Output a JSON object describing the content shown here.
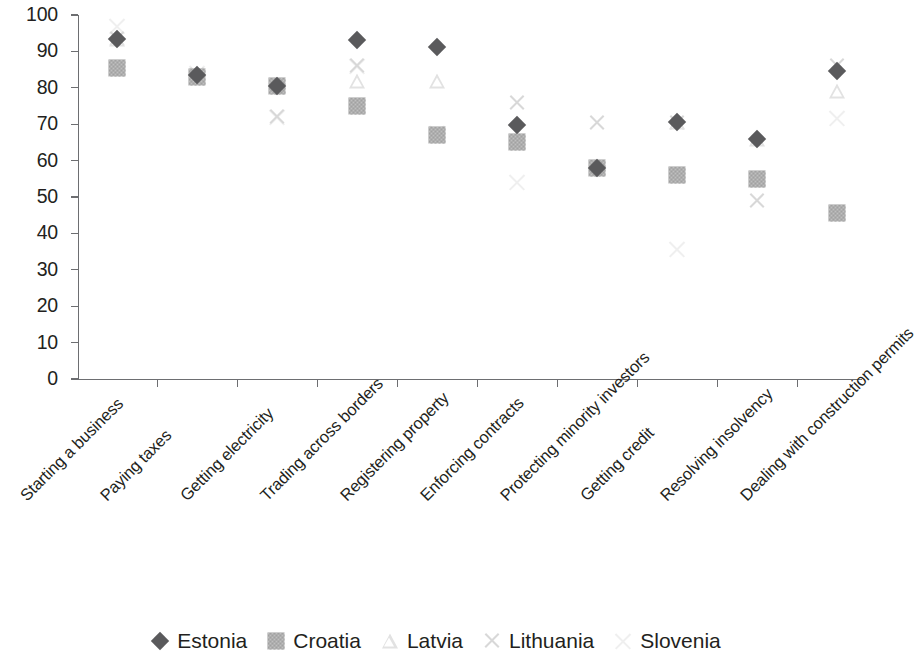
{
  "chart_data": {
    "type": "scatter",
    "title": "",
    "subtitle": "",
    "xlabel": "",
    "ylabel": "",
    "ylim": [
      0,
      100
    ],
    "ytick_step": 10,
    "yticks": [
      0,
      10,
      20,
      30,
      40,
      50,
      60,
      70,
      80,
      90,
      100
    ],
    "grid": false,
    "legend_position": "bottom",
    "xlabel_rotation": -45,
    "categories": [
      "Starting a business",
      "Paying taxes",
      "Getting electricity",
      "Trading across borders",
      "Registering property",
      "Enforcing contracts",
      "Protecting minority investors",
      "Getting credit",
      "Resolving insolvency",
      "Dealing with construction permits"
    ],
    "series": [
      {
        "name": "Estonia",
        "marker": "filled-diamond",
        "color": "#5a5a5c",
        "values": [
          93.5,
          83.5,
          80.5,
          93.0,
          91.2,
          69.8,
          58.0,
          70.5,
          66.0,
          84.5
        ]
      },
      {
        "name": "Croatia",
        "marker": "textured-square",
        "color": "#bfbfbf",
        "values": [
          85.5,
          83.0,
          80.5,
          75.0,
          67.0,
          65.0,
          58.0,
          56.0,
          55.0,
          45.5
        ]
      },
      {
        "name": "Latvia",
        "marker": "light-triangle",
        "color": "#e2e2e2",
        "values": [
          93.5,
          83.5,
          80.5,
          82.0,
          82.0,
          65.0,
          58.5,
          70.5,
          66.0,
          79.0
        ]
      },
      {
        "name": "Lithuania",
        "marker": "cross-x",
        "color": "#d8d8d8",
        "values": [
          93.5,
          83.5,
          72.0,
          86.0,
          67.5,
          76.0,
          70.5,
          70.5,
          49.0,
          86.0
        ]
      },
      {
        "name": "Slovenia",
        "marker": "light-cross-x",
        "color": "#efefef",
        "values": [
          97.0,
          84.0,
          72.0,
          86.0,
          67.5,
          54.0,
          58.0,
          35.5,
          55.0,
          71.5
        ]
      }
    ]
  },
  "legend": {
    "items": [
      {
        "label": "Estonia",
        "marker": "filled-diamond"
      },
      {
        "label": "Croatia",
        "marker": "textured-square"
      },
      {
        "label": "Latvia",
        "marker": "light-triangle"
      },
      {
        "label": "Lithuania",
        "marker": "cross-x"
      },
      {
        "label": "Slovenia",
        "marker": "light-cross-x"
      }
    ]
  }
}
